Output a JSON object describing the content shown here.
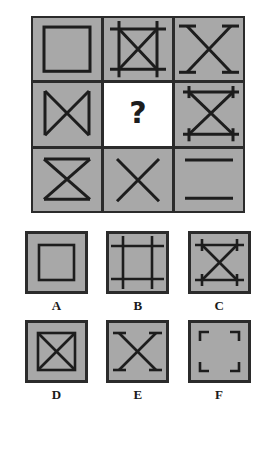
{
  "puzzle": {
    "type": "visual-analogy-matrix",
    "grid_size": "3x3",
    "missing_cell_index": 4,
    "missing_marker": "?",
    "colors": {
      "tile_fill": "#a8a8a8",
      "stroke": "#2b2b2b",
      "blank_fill": "#ffffff",
      "label_color": "#1a1a1a"
    },
    "matrix": [
      {
        "position": "row1-col1",
        "name": "square",
        "description": "plain square outline"
      },
      {
        "position": "row1-col2",
        "name": "hash-square-with-x",
        "description": "square with overhanging corner lines and an X inside"
      },
      {
        "position": "row1-col3",
        "name": "x-with-t-caps",
        "description": "X with short perpendicular caps at each arm end"
      },
      {
        "position": "row2-col1",
        "name": "bowtie-horizontal",
        "description": "X with vertical lines on left and right sides"
      },
      {
        "position": "row2-col2",
        "name": "missing",
        "description": "blank white cell containing a question mark"
      },
      {
        "position": "row2-col3",
        "name": "hourglass-with-t-caps",
        "description": "X with horizontal lines top and bottom, with end caps"
      },
      {
        "position": "row3-col1",
        "name": "hourglass",
        "description": "X with horizontal lines top and bottom"
      },
      {
        "position": "row3-col2",
        "name": "x",
        "description": "plain X"
      },
      {
        "position": "row3-col3",
        "name": "two-horizontal-lines",
        "description": "two horizontal lines, top and bottom"
      }
    ],
    "options": [
      {
        "label": "A",
        "name": "square",
        "description": "plain square outline"
      },
      {
        "label": "B",
        "name": "hash-square",
        "description": "square made of four overhanging lines"
      },
      {
        "label": "C",
        "name": "hourglass-with-t-caps",
        "description": "X with horizontal lines top and bottom, with end caps"
      },
      {
        "label": "D",
        "name": "square-with-x",
        "description": "square outline with an X inside"
      },
      {
        "label": "E",
        "name": "x-with-t-caps",
        "description": "X with short perpendicular caps at each arm end"
      },
      {
        "label": "F",
        "name": "corner-brackets",
        "description": "four L-shaped corner brackets"
      }
    ]
  }
}
